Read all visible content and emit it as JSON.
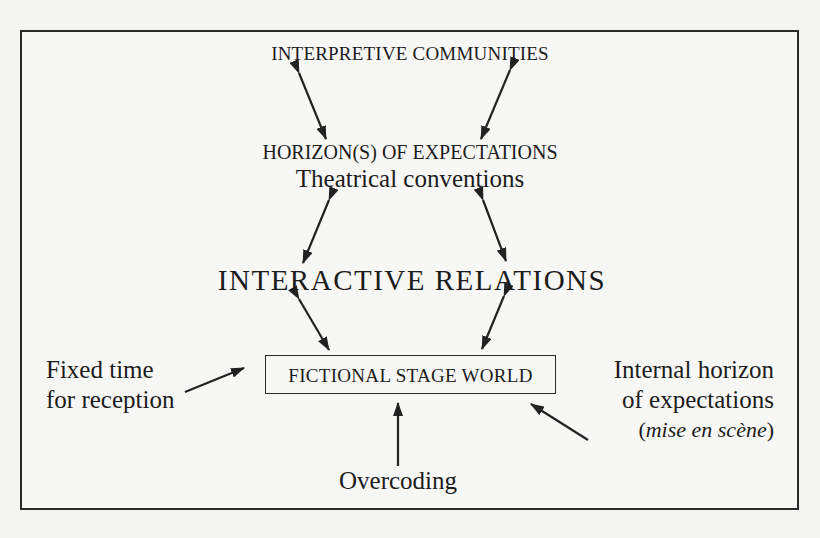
{
  "diagram": {
    "nodes": {
      "interpretive_communities": "INTERPRETIVE COMMUNITIES",
      "horizons_of_expectations": "HORIZON(S) OF EXPECTATIONS",
      "theatrical_conventions": "Theatrical conventions",
      "interactive_relations": "INTERACTIVE RELATIONS",
      "fictional_stage_world": "FICTIONAL STAGE WORLD",
      "fixed_time_line1": "Fixed time",
      "fixed_time_line2": "for reception",
      "internal_horizon_line1": "Internal horizon",
      "internal_horizon_line2": "of expectations",
      "mise_en_scene_open": "(",
      "mise_en_scene": "mise en scène",
      "mise_en_scene_close": ")",
      "overcoding": "Overcoding"
    },
    "edges": [
      {
        "from": "interpretive_communities",
        "to": "horizons_of_expectations",
        "type": "bidirectional",
        "side": "left"
      },
      {
        "from": "interpretive_communities",
        "to": "horizons_of_expectations",
        "type": "bidirectional",
        "side": "right"
      },
      {
        "from": "theatrical_conventions",
        "to": "interactive_relations",
        "type": "bidirectional",
        "side": "left"
      },
      {
        "from": "theatrical_conventions",
        "to": "interactive_relations",
        "type": "bidirectional",
        "side": "right"
      },
      {
        "from": "interactive_relations",
        "to": "fictional_stage_world",
        "type": "bidirectional",
        "side": "left"
      },
      {
        "from": "interactive_relations",
        "to": "fictional_stage_world",
        "type": "bidirectional",
        "side": "right"
      },
      {
        "from": "fixed_time",
        "to": "fictional_stage_world",
        "type": "directed"
      },
      {
        "from": "internal_horizon",
        "to": "fictional_stage_world",
        "type": "directed"
      },
      {
        "from": "overcoding",
        "to": "fictional_stage_world",
        "type": "directed"
      }
    ],
    "colors": {
      "ink": "#1c1c1c",
      "paper": "#f4f4f2"
    }
  }
}
